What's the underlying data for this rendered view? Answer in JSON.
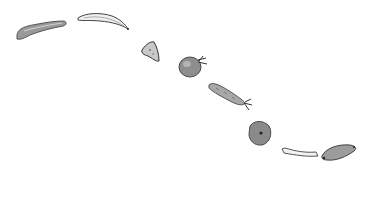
{
  "scene": {
    "description": "Pencil sketch of vegetables and food items arranged along a descending diagonal curve on white background",
    "background": "#ffffff",
    "items": [
      {
        "name": "zucchini",
        "fill": "#9a9a9a",
        "stroke": "#555555"
      },
      {
        "name": "banana",
        "fill": "#ececec",
        "stroke": "#444444"
      },
      {
        "name": "ginger-piece",
        "fill": "#c8c8c8",
        "stroke": "#333333"
      },
      {
        "name": "tomato",
        "fill": "#8e8e8e",
        "stroke": "#4a4a4a"
      },
      {
        "name": "carrot",
        "fill": "#a8a8a8",
        "stroke": "#555555"
      },
      {
        "name": "onion-slice",
        "fill": "#8a8a8a",
        "stroke": "#4a4a4a"
      },
      {
        "name": "breadstick",
        "fill": "#f2f2f2",
        "stroke": "#555555"
      },
      {
        "name": "sweet-potato",
        "fill": "#9c9c9c",
        "stroke": "#444444"
      }
    ]
  }
}
